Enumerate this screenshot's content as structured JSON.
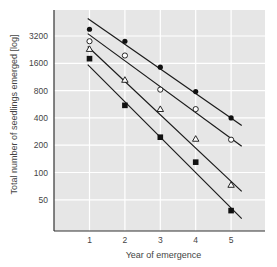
{
  "chart_data": {
    "type": "scatter",
    "title": "",
    "xlabel": "Year of emergence",
    "ylabel": "Total number of seedlings emerged [log]",
    "yscale": "log2",
    "x": [
      1,
      2,
      3,
      4,
      5
    ],
    "xlim": [
      0.3,
      5.9
    ],
    "ylim": [
      28,
      5400
    ],
    "xticks": [
      "1",
      "2",
      "3",
      "4",
      "5"
    ],
    "yticks": [
      {
        "value": 3200,
        "label": "3200"
      },
      {
        "value": 1600,
        "label": "1600"
      },
      {
        "value": 800,
        "label": "800"
      },
      {
        "value": 400,
        "label": "400"
      },
      {
        "value": 200,
        "label": "200"
      },
      {
        "value": 100,
        "label": "100"
      },
      {
        "value": 50,
        "label": "50"
      }
    ],
    "grid": true,
    "series": [
      {
        "name": "filled-circle",
        "marker": "filled-circle",
        "values": [
          3800,
          2800,
          1450,
          780,
          400
        ],
        "fit": {
          "x_start": 0.95,
          "y_start": 5000,
          "x_end": 5.3,
          "y_end": 330
        }
      },
      {
        "name": "open-circle",
        "marker": "open-circle",
        "values": [
          2800,
          1950,
          820,
          500,
          230
        ],
        "fit": {
          "x_start": 0.95,
          "y_start": 3400,
          "x_end": 5.3,
          "y_end": 195
        }
      },
      {
        "name": "open-triangle",
        "marker": "open-triangle",
        "values": [
          2300,
          1050,
          500,
          235,
          73
        ],
        "fit": {
          "x_start": 0.95,
          "y_start": 2450,
          "x_end": 5.3,
          "y_end": 62
        }
      },
      {
        "name": "filled-square",
        "marker": "filled-square",
        "values": [
          1800,
          550,
          245,
          130,
          38
        ],
        "fit": {
          "x_start": 0.95,
          "y_start": 1550,
          "x_end": 5.3,
          "y_end": 31
        }
      }
    ]
  },
  "colors": {
    "plot_bg": "#e6e6e6",
    "grid": "#ffffff",
    "line": "#1a1a1a",
    "marker": "#111111"
  }
}
